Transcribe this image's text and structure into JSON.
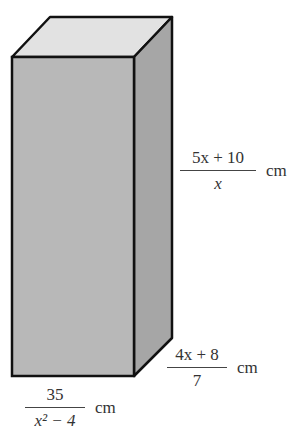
{
  "figure": {
    "type": "rectangular-prism",
    "colors": {
      "top_face": "#e2e2e2",
      "front_face": "#b8b8b8",
      "side_face": "#a6a6a6",
      "edge": "#111111"
    }
  },
  "labels": {
    "height": {
      "numerator": "5x + 10",
      "denominator": "x",
      "unit": "cm"
    },
    "depth": {
      "numerator": "4x + 8",
      "denominator": "7",
      "unit": "cm"
    },
    "width": {
      "numerator": "35",
      "denominator": "x² − 4",
      "unit": "cm"
    }
  }
}
